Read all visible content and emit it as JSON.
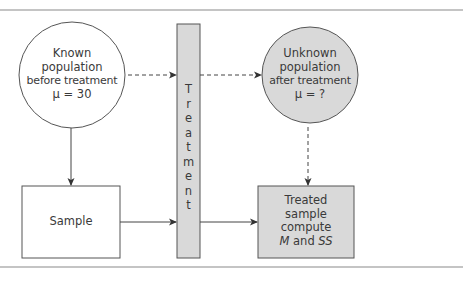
{
  "diagram": {
    "known_population": {
      "line1": "Known",
      "line2": "population",
      "line3": "before treatment",
      "line4": "μ = 30"
    },
    "treatment": {
      "label": "Treatment",
      "letters": [
        "T",
        "r",
        "e",
        "a",
        "t",
        "m",
        "e",
        "n",
        "t"
      ]
    },
    "unknown_population": {
      "line1": "Unknown",
      "line2": "population",
      "line3": "after treatment",
      "line4": "μ = ?"
    },
    "sample": {
      "label": "Sample"
    },
    "treated_sample": {
      "line1": "Treated",
      "line2": "sample",
      "line3": "compute",
      "line4_m": "M",
      "line4_and": " and ",
      "line4_ss": "SS"
    },
    "colors": {
      "shaded_fill": "#d9d9d9",
      "stroke": "#555555",
      "rule": "#8a8a8a"
    }
  }
}
